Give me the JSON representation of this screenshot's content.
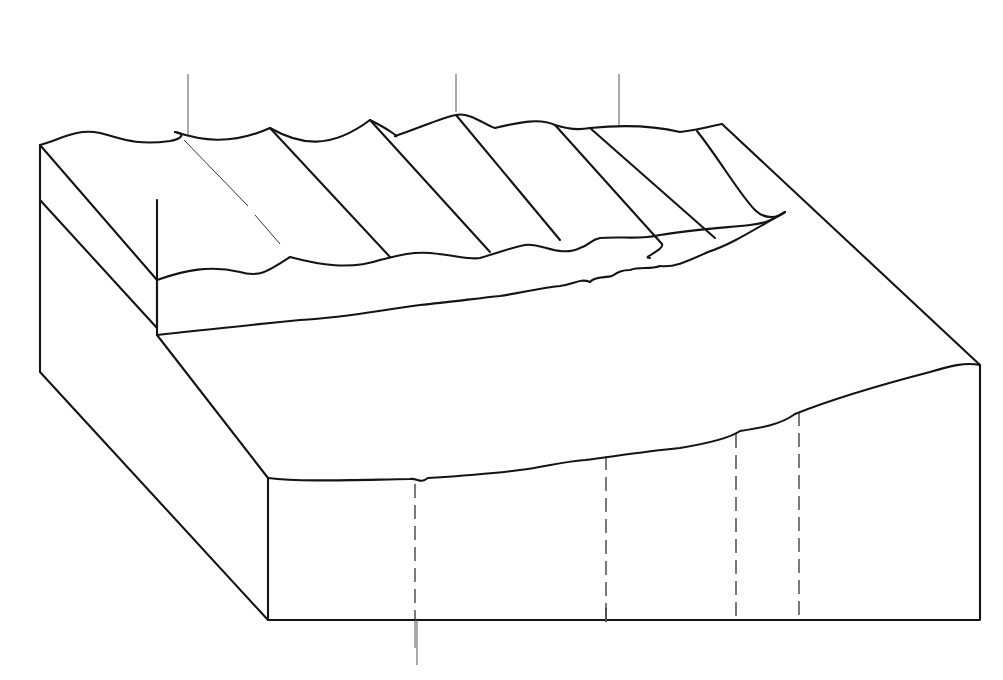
{
  "figure": {
    "top_region_labels": [
      {
        "id": "offshore",
        "text": "OFFSHORE"
      },
      {
        "id": "nearshore",
        "text": "NEARSHORE"
      }
    ],
    "zone_labels": [
      {
        "id": "build-up-zone",
        "text": "Build-up\nzone"
      },
      {
        "id": "surf-zone",
        "text": "Surf\nzone"
      },
      {
        "id": "swash-zone",
        "text": "Swash\nzone"
      }
    ],
    "facies_labels": [
      {
        "id": "asymmetric-ripple-facies",
        "text": "Asymmetric\nripple\nfacies"
      },
      {
        "id": "lunate-megaripple-outer-rough-facies",
        "text": "Lunate\nmegaripple\nouter rough\nfacies"
      },
      {
        "id": "outer-planar-facies",
        "text": "Outer\nplanar\nfacies"
      },
      {
        "id": "inner-rough-facies",
        "text": "Inner\nrough\nfacies"
      },
      {
        "id": "inner-planar-facies",
        "text": "Inner\nplanar\nfacies"
      }
    ],
    "bottom_region_labels": [
      {
        "id": "offshore",
        "text": "OFFSHORE"
      },
      {
        "id": "nearshore",
        "text": "NEARSHORE"
      }
    ],
    "colors": {
      "ink": "#141414",
      "paper": "#ffffff"
    }
  }
}
